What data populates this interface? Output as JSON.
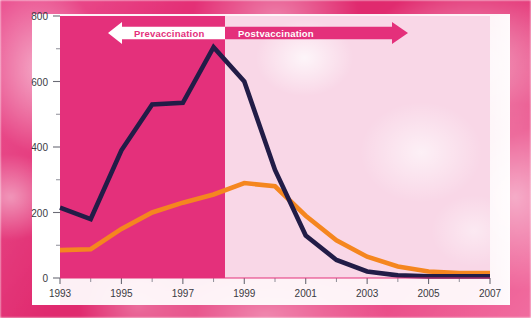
{
  "chart_data": {
    "type": "line",
    "title": "",
    "subtitle": "",
    "xlabel": "",
    "ylabel": "",
    "x": [
      1993,
      1994,
      1995,
      1996,
      1997,
      1998,
      1999,
      2000,
      2001,
      2002,
      2003,
      2004,
      2005,
      2006,
      2007
    ],
    "xtick_labels": [
      "1993",
      "1995",
      "1997",
      "1999",
      "2001",
      "2003",
      "2005",
      "2007"
    ],
    "xtick_values": [
      1993,
      1995,
      1997,
      1999,
      2001,
      2003,
      2005,
      2007
    ],
    "xminor_values": [
      1994,
      1996,
      1998,
      2000,
      2002,
      2004,
      2006
    ],
    "xlim": [
      1993,
      2007
    ],
    "ytick_labels": [
      "0",
      "200",
      "400",
      "600",
      "800"
    ],
    "ytick_values": [
      0,
      200,
      400,
      600,
      800
    ],
    "yminor_values": [
      100,
      300,
      500,
      700
    ],
    "ylim": [
      0,
      800
    ],
    "grid": false,
    "legend_position": "none",
    "series": [
      {
        "name": "navy-series",
        "color": "#221c47",
        "values": [
          215,
          180,
          390,
          530,
          535,
          705,
          600,
          330,
          130,
          55,
          20,
          8,
          5,
          5,
          5
        ]
      },
      {
        "name": "orange-series",
        "color": "#f5861f",
        "values": [
          85,
          88,
          150,
          200,
          230,
          255,
          290,
          280,
          190,
          115,
          65,
          35,
          20,
          15,
          15
        ]
      }
    ],
    "annotations": [
      {
        "id": "prevaccination-banner",
        "label": "Prevaccination",
        "direction": "left",
        "x_range": [
          1993,
          1998
        ],
        "background": "#ffffff",
        "text_color": "#e4307b"
      },
      {
        "id": "postvaccination-banner",
        "label": "Postvaccination",
        "direction": "right",
        "x_range": [
          1998,
          2007
        ],
        "background": "#e4307b",
        "text_color": "#ffffff"
      }
    ],
    "regions": [
      {
        "id": "prevaccination-region",
        "x_range": [
          1993,
          1998
        ],
        "color": "#e4307b"
      },
      {
        "id": "postvaccination-region",
        "x_range": [
          1998,
          2007
        ],
        "color": "#f9d7e7"
      }
    ]
  },
  "colors": {
    "navy": "#221c47",
    "orange": "#f5861f",
    "magenta": "#e4307b",
    "pale_pink": "#f9d7e7",
    "card": "#ffffff",
    "tick_text": "#3a3a42"
  }
}
